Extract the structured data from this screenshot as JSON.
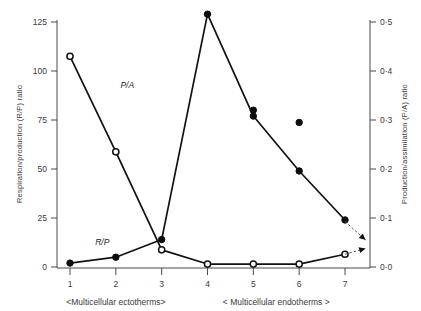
{
  "chart_data": {
    "type": "line",
    "title": "",
    "xlabel": "",
    "ylabel": "Respiration/production (R/P) ratio",
    "ylabel_right": "Production/assimilation (P/A) ratio",
    "x": [
      1,
      2,
      3,
      4,
      5,
      6,
      7
    ],
    "xtick_labels": [
      "1",
      "2",
      "3",
      "4",
      "5",
      "6",
      "7"
    ],
    "ylim": [
      0,
      125
    ],
    "ytick_labels": [
      "0",
      "25",
      "50",
      "75",
      "100",
      "125"
    ],
    "ytick_values": [
      0,
      25,
      50,
      75,
      100,
      125
    ],
    "ylim_right": [
      0.0,
      0.5
    ],
    "ytick_labels_right": [
      "0·0",
      "0·1",
      "0·2",
      "0·3",
      "0·4",
      "0·5"
    ],
    "ytick_values_right": [
      0.0,
      0.1,
      0.2,
      0.3,
      0.4,
      0.5
    ],
    "grid": false,
    "legend": "inline-series-labels",
    "series": [
      {
        "name": "P/A",
        "label": "P/A",
        "axis": "right",
        "marker": "open-circle",
        "x": [
          1,
          2,
          3,
          4,
          5,
          6,
          7
        ],
        "values": [
          0.43,
          0.235,
          0.035,
          0.006,
          0.006,
          0.006,
          0.026
        ],
        "label_x": 2.1,
        "label_y": 0.365
      },
      {
        "name": "R/P",
        "label": "R/P",
        "axis": "left",
        "marker": "filled-circle",
        "x": [
          1,
          2,
          3,
          4,
          5,
          6,
          7
        ],
        "values": [
          2,
          5,
          14,
          129,
          77,
          49,
          24
        ],
        "label_x": 1.55,
        "label_y": 11
      },
      {
        "name": "P/A isolated points",
        "label": "",
        "axis": "right",
        "marker": "filled-circle",
        "x": [
          5,
          6
        ],
        "values": [
          0.32,
          0.295
        ]
      }
    ],
    "annotations": [
      {
        "name": "extrapolation-arrow-rp",
        "text": "",
        "from_x": 7,
        "from_y_right": 0.093,
        "to_x": 7.45,
        "to_y_right": 0.055
      },
      {
        "name": "extrapolation-arrow-pa",
        "text": "",
        "from_x": 7,
        "from_y_right": 0.026,
        "to_x": 7.45,
        "to_y_right": 0.038
      }
    ],
    "group_brackets": [
      {
        "label": "<Multicellular ectotherms>",
        "from_x": 1,
        "to_x": 3
      },
      {
        "label": "<   Multicellular endotherms   >",
        "from_x": 4,
        "to_x": 7
      }
    ]
  }
}
